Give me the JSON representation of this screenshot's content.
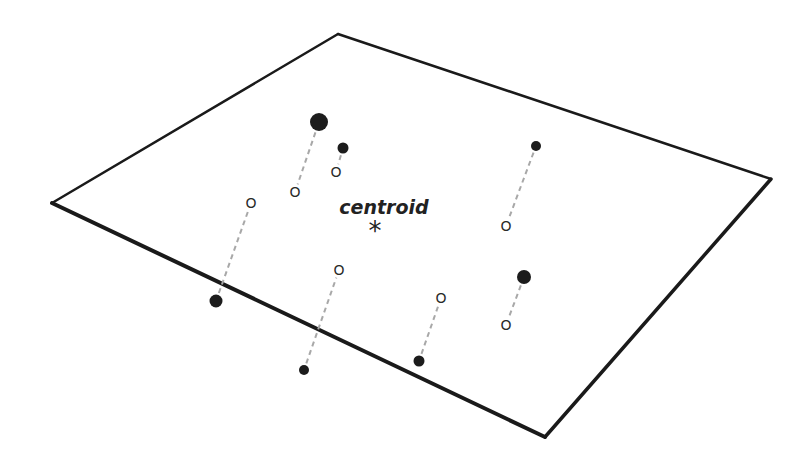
{
  "diagram": {
    "type": "projection-onto-plane",
    "plane": {
      "corners": [
        [
          52,
          203
        ],
        [
          338,
          34
        ],
        [
          771,
          179
        ],
        [
          545,
          437
        ]
      ],
      "stroke_back": 2.5,
      "stroke_front": 4,
      "color": "#1a1a1a"
    },
    "centroid": {
      "label": "centroid",
      "marker": "*",
      "label_pos": [
        384,
        214
      ],
      "marker_pos": [
        375,
        231
      ]
    },
    "projection_line_color": "#a8a8a8",
    "points": [
      {
        "id": "p1",
        "filled": [
          319,
          122
        ],
        "radius": 9,
        "projected": [
          295,
          192
        ],
        "open_glyph": "O"
      },
      {
        "id": "p2",
        "filled": [
          343,
          148
        ],
        "radius": 5.5,
        "projected": [
          336,
          172
        ],
        "open_glyph": "O"
      },
      {
        "id": "p3",
        "filled": [
          216,
          301
        ],
        "radius": 6.5,
        "projected": [
          251,
          203
        ],
        "open_glyph": "O"
      },
      {
        "id": "p4",
        "filled": [
          304,
          370
        ],
        "radius": 5,
        "projected": [
          339,
          270
        ],
        "open_glyph": "O"
      },
      {
        "id": "p5",
        "filled": [
          419,
          361
        ],
        "radius": 5.5,
        "projected": [
          441,
          298
        ],
        "open_glyph": "O"
      },
      {
        "id": "p6",
        "filled": [
          536,
          146
        ],
        "radius": 5,
        "projected": [
          506,
          226
        ],
        "open_glyph": "O"
      },
      {
        "id": "p7",
        "filled": [
          524,
          277
        ],
        "radius": 7,
        "projected": [
          506,
          325
        ],
        "open_glyph": "O"
      }
    ]
  }
}
